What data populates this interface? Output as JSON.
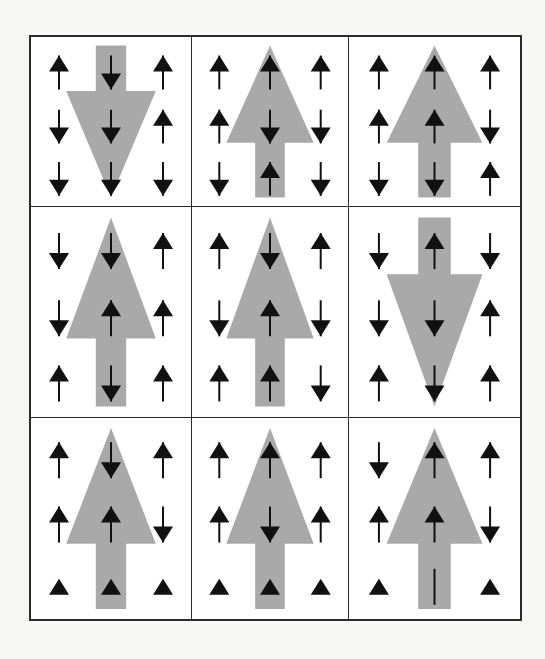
{
  "figure": {
    "title": "",
    "colors": {
      "big_arrow": "#a9a9a9",
      "small_arrow": "#111111",
      "grid_line": "#2a2a2a",
      "background": "#ffffff"
    },
    "legend": {
      "u": "up arrow",
      "d": "down arrow",
      "t": "triangle head only (up, no stem)",
      "s": "stem only (no head)"
    },
    "cells": [
      {
        "row": 1,
        "col": 1,
        "big": "down",
        "small": [
          [
            "u",
            "d",
            "u"
          ],
          [
            "d",
            "d",
            "u"
          ],
          [
            "d",
            "d",
            "d"
          ]
        ]
      },
      {
        "row": 1,
        "col": 2,
        "big": "up",
        "small": [
          [
            "u",
            "u",
            "u"
          ],
          [
            "u",
            "d",
            "d"
          ],
          [
            "d",
            "u",
            "d"
          ]
        ]
      },
      {
        "row": 1,
        "col": 3,
        "big": "up",
        "small": [
          [
            "u",
            "u",
            "u"
          ],
          [
            "u",
            "u",
            "d"
          ],
          [
            "d",
            "d",
            "u"
          ]
        ]
      },
      {
        "row": 2,
        "col": 1,
        "big": "up",
        "small": [
          [
            "d",
            "d",
            "u"
          ],
          [
            "d",
            "u",
            "u"
          ],
          [
            "u",
            "d",
            "u"
          ]
        ]
      },
      {
        "row": 2,
        "col": 2,
        "big": "up",
        "small": [
          [
            "u",
            "d",
            "u"
          ],
          [
            "d",
            "u",
            "d"
          ],
          [
            "u",
            "u",
            "d"
          ]
        ]
      },
      {
        "row": 2,
        "col": 3,
        "big": "down",
        "small": [
          [
            "d",
            "u",
            "d"
          ],
          [
            "d",
            "d",
            "u"
          ],
          [
            "u",
            "d",
            "u"
          ]
        ]
      },
      {
        "row": 3,
        "col": 1,
        "big": "up",
        "small": [
          [
            "u",
            "d",
            "u"
          ],
          [
            "u",
            "u",
            "d"
          ],
          [
            "t",
            "t",
            "t"
          ]
        ]
      },
      {
        "row": 3,
        "col": 2,
        "big": "up",
        "small": [
          [
            "u",
            "u",
            "u"
          ],
          [
            "u",
            "d",
            "u"
          ],
          [
            "t",
            "t",
            "t"
          ]
        ]
      },
      {
        "row": 3,
        "col": 3,
        "big": "up",
        "small": [
          [
            "d",
            "u",
            "u"
          ],
          [
            "u",
            "u",
            "d"
          ],
          [
            "t",
            "s",
            "t"
          ]
        ]
      }
    ]
  }
}
